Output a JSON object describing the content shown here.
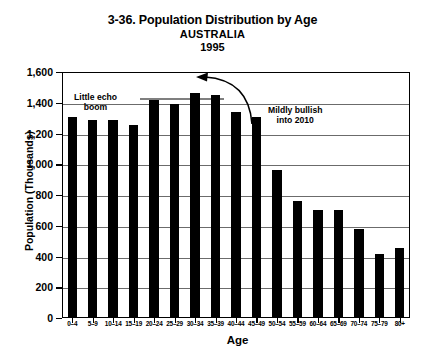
{
  "chart_data": {
    "type": "bar",
    "title": "3-36. Population Distribution by Age",
    "subtitle": "AUSTRALIA",
    "year": "1995",
    "xlabel": "Age",
    "ylabel": "Population (Thousands)",
    "ylim": [
      0,
      1600
    ],
    "ytick_step": 200,
    "grid": true,
    "legend": "none",
    "bar_color": "#000000",
    "categories": [
      "0–4",
      "5–9",
      "10–14",
      "15–19",
      "20–24",
      "25–29",
      "30–34",
      "35–39",
      "40–44",
      "45–49",
      "50–54",
      "55–59",
      "60–64",
      "65–69",
      "70–74",
      "75–79",
      "80+"
    ],
    "values": [
      1310,
      1285,
      1285,
      1255,
      1420,
      1390,
      1465,
      1450,
      1340,
      1310,
      965,
      760,
      700,
      705,
      580,
      415,
      455
    ],
    "ytick_labels": [
      "0",
      "200",
      "400",
      "600",
      "800",
      "1,000",
      "1,200",
      "1,400",
      "1,600"
    ],
    "ytick_values": [
      0,
      200,
      400,
      600,
      800,
      1000,
      1200,
      1400,
      1600
    ],
    "annotations": [
      {
        "id": "little-echo-boom",
        "line1": "Little echo",
        "line2": "boom",
        "target_category": "20–24"
      },
      {
        "id": "mildly-bullish",
        "line1": "Mildly bullish",
        "line2": "into 2010",
        "target_category": "45–49"
      }
    ]
  }
}
